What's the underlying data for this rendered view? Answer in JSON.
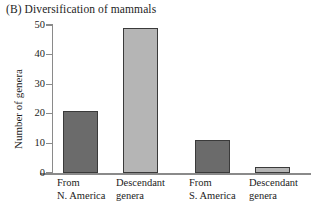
{
  "figure": {
    "panel_label": "(B)",
    "title": "(B) Diversification of mammals"
  },
  "chart_data": {
    "type": "bar",
    "title": "(B) Diversification of mammals",
    "xlabel": "",
    "ylabel": "Number of genera",
    "categories": [
      "From\nN. America",
      "Descendant\ngenera",
      "From\nS. America",
      "Descendant\ngenera"
    ],
    "category_lines": [
      [
        "From",
        "N. America"
      ],
      [
        "Descendant",
        "genera"
      ],
      [
        "From",
        "S. America"
      ],
      [
        "Descendant",
        "genera"
      ]
    ],
    "values": [
      21,
      49,
      11,
      2
    ],
    "bar_colors": [
      "#6b6b6b",
      "#b5b5b5",
      "#6b6b6b",
      "#b5b5b5"
    ],
    "bar_edge_color": "#3a3a3a",
    "ylim": [
      0,
      50
    ],
    "yticks": [
      0,
      10,
      20,
      30,
      40,
      50
    ],
    "ytick_labels": [
      "0",
      "10",
      "20",
      "30",
      "40",
      "50"
    ],
    "grid": false,
    "legend": null,
    "axis_color": "#8a8a8a"
  }
}
